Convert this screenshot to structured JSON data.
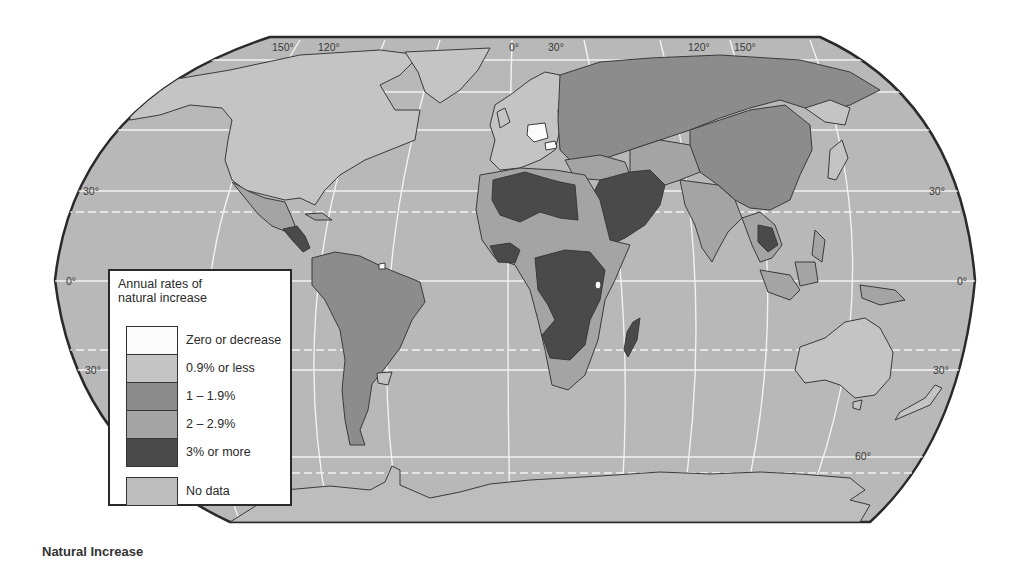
{
  "caption": "Natural Increase",
  "legend": {
    "title_line1": "Annual rates of",
    "title_line2": "natural increase",
    "items": [
      {
        "label": "Zero or decrease",
        "color": "#fbfbfb"
      },
      {
        "label": "0.9% or less",
        "color": "#c4c4c4"
      },
      {
        "label": "1 – 1.9%",
        "color": "#8c8c8c"
      },
      {
        "label": "2 – 2.9%",
        "color": "#a4a4a4"
      },
      {
        "label": "3% or more",
        "color": "#4a4a4a"
      }
    ],
    "no_data": {
      "label": "No data",
      "color": "#bdbdbd"
    }
  },
  "graticule_labels": {
    "top": [
      "150°",
      "120°",
      "0°",
      "30°",
      "120°",
      "150°"
    ],
    "left": [
      "30°",
      "0°",
      "30°"
    ],
    "right": [
      "30°",
      "0°",
      "30°",
      "60°"
    ]
  },
  "colors": {
    "ocean": "#b8b8b8",
    "outline": "#2a2a2a",
    "graticule": "#f2f2f2"
  },
  "map_data": {
    "title": "Natural Increase",
    "variable": "Annual rates of natural increase",
    "categories": [
      "Zero or decrease",
      "0.9% or less",
      "1 – 1.9%",
      "2 – 2.9%",
      "3% or more",
      "No data"
    ],
    "regions": [
      {
        "name": "North America (USA/Canada)",
        "category": "0.9% or less"
      },
      {
        "name": "Greenland",
        "category": "0.9% or less"
      },
      {
        "name": "Mexico",
        "category": "2 – 2.9%"
      },
      {
        "name": "Central America (Guatemala/Honduras/Nicaragua)",
        "category": "3% or more"
      },
      {
        "name": "South America",
        "category": "1 – 1.9%"
      },
      {
        "name": "Western Europe",
        "category": "0.9% or less"
      },
      {
        "name": "Germany",
        "category": "Zero or decrease"
      },
      {
        "name": "Hungary",
        "category": "Zero or decrease"
      },
      {
        "name": "Russia / Former USSR",
        "category": "1 – 1.9%"
      },
      {
        "name": "North Africa (Algeria/Libya)",
        "category": "3% or more"
      },
      {
        "name": "Sahel / West Africa",
        "category": "2 – 2.9%"
      },
      {
        "name": "Central & East Africa",
        "category": "3% or more"
      },
      {
        "name": "Southern Africa",
        "category": "2 – 2.9%"
      },
      {
        "name": "Madagascar",
        "category": "3% or more"
      },
      {
        "name": "Arabian Peninsula / Iran",
        "category": "3% or more"
      },
      {
        "name": "China",
        "category": "1 – 1.9%"
      },
      {
        "name": "India / South Asia",
        "category": "2 – 2.9%"
      },
      {
        "name": "Laos / Cambodia",
        "category": "3% or more"
      },
      {
        "name": "Japan",
        "category": "0.9% or less"
      },
      {
        "name": "Indonesia / Philippines",
        "category": "2 – 2.9%"
      },
      {
        "name": "Australia",
        "category": "0.9% or less"
      },
      {
        "name": "New Zealand",
        "category": "0.9% or less"
      },
      {
        "name": "Antarctica",
        "category": "No data"
      }
    ]
  }
}
